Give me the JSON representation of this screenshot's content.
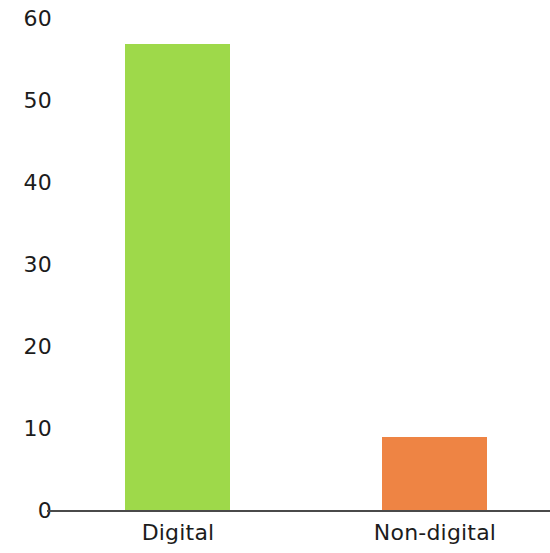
{
  "chart_data": {
    "type": "bar",
    "title": "",
    "subtitle": "",
    "xlabel": "",
    "ylabel": "",
    "categories": [
      "Digital",
      "Non-digital"
    ],
    "values": [
      57,
      9
    ],
    "ylim": [
      0,
      60
    ],
    "yticks": [
      0,
      10,
      20,
      30,
      40,
      50,
      60
    ],
    "ytick_labels": [
      "0",
      "10",
      "20",
      "30",
      "40",
      "50",
      "60"
    ],
    "grid": false,
    "legend": null,
    "bar_colors": [
      "#9ED94A",
      "#EE8444"
    ],
    "axis_color": "#4a4a4a",
    "text_color": "#1c1c1c",
    "background": "#ffffff",
    "bars": [
      {
        "category": "Digital",
        "value": 57,
        "color": "#9ED94A"
      },
      {
        "category": "Non-digital",
        "value": 9,
        "color": "#EE8444"
      }
    ]
  }
}
